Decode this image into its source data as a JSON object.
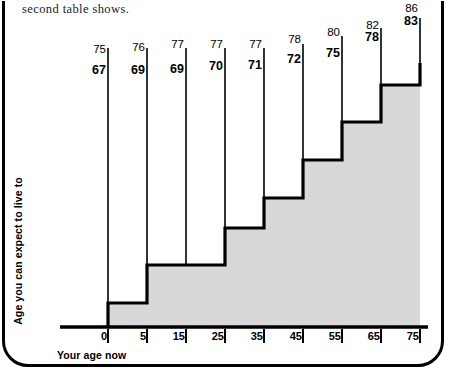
{
  "caption": {
    "text": "second table shows."
  },
  "axes": {
    "x_title": "Your age now",
    "y_title": "Age you can expect to live to"
  },
  "colors": {
    "stroke": "#000000",
    "fill": "#d8d8d8",
    "background": "#ffffff"
  },
  "chart_data": {
    "type": "bar",
    "title": "",
    "subtitle": "",
    "xlabel": "Your age now",
    "ylabel": "Age you can expect to live to",
    "xlim": [
      -3,
      80
    ],
    "ylim": [
      60,
      90
    ],
    "grid": false,
    "legend": null,
    "categories": [
      "0",
      "5",
      "15",
      "25",
      "35",
      "45",
      "55",
      "65",
      "75"
    ],
    "series": [
      {
        "name": "female",
        "values": [
          75,
          76,
          77,
          77,
          77,
          78,
          80,
          82,
          86
        ]
      },
      {
        "name": "male",
        "values": [
          67,
          69,
          69,
          70,
          71,
          72,
          75,
          78,
          83
        ]
      }
    ],
    "step_levels": [
      67,
      69,
      69,
      70,
      71,
      72,
      75,
      78,
      83
    ],
    "annotations": [
      {
        "x": "0",
        "top": "75",
        "bottom": "67"
      },
      {
        "x": "5",
        "top": "76",
        "bottom": "69"
      },
      {
        "x": "15",
        "top": "77",
        "bottom": "69"
      },
      {
        "x": "25",
        "top": "77",
        "bottom": "70"
      },
      {
        "x": "35",
        "top": "77",
        "bottom": "71"
      },
      {
        "x": "45",
        "top": "78",
        "bottom": "72"
      },
      {
        "x": "55",
        "top": "80",
        "bottom": "75"
      },
      {
        "x": "65",
        "top": "82",
        "bottom": "78"
      },
      {
        "x": "75",
        "top": "86",
        "bottom": "83"
      }
    ],
    "tick_labels": [
      "0",
      "5",
      "15",
      "25",
      "35",
      "45",
      "55",
      "65",
      "75"
    ]
  },
  "geometry": {
    "tick_x_px": [
      108,
      147,
      186,
      225,
      264,
      303,
      342,
      381,
      420
    ],
    "step_top_px": [
      303,
      265,
      265,
      228,
      198,
      160,
      122,
      85,
      63
    ],
    "baseline_y_px": 327,
    "line_top_px": [
      48,
      48,
      48,
      48,
      48,
      44,
      36,
      28,
      18
    ],
    "label_top_y_px": [
      43,
      41,
      38,
      38,
      38,
      33,
      26,
      19,
      2
    ],
    "label_bottom_y_px": [
      63,
      63,
      62,
      59,
      58,
      52,
      46,
      30,
      14
    ]
  }
}
